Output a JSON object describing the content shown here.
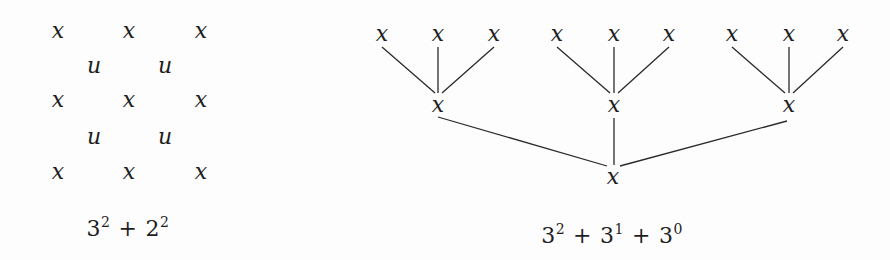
{
  "figure": {
    "background": "#fdfdfd",
    "ink": "#1e1e1e"
  },
  "left_panel": {
    "lattice": {
      "x_label": "x",
      "u_label": "u",
      "x_nodes": [
        {
          "x": 58,
          "y": 31
        },
        {
          "x": 129,
          "y": 31
        },
        {
          "x": 201,
          "y": 31
        },
        {
          "x": 58,
          "y": 100
        },
        {
          "x": 129,
          "y": 100
        },
        {
          "x": 201,
          "y": 100
        },
        {
          "x": 58,
          "y": 172
        },
        {
          "x": 129,
          "y": 172
        },
        {
          "x": 201,
          "y": 172
        }
      ],
      "u_nodes": [
        {
          "x": 94,
          "y": 66
        },
        {
          "x": 165,
          "y": 66
        },
        {
          "x": 94,
          "y": 137
        },
        {
          "x": 165,
          "y": 137
        }
      ]
    },
    "caption": {
      "terms": [
        {
          "base": "3",
          "exp": "2"
        },
        {
          "base": "2",
          "exp": "2"
        }
      ],
      "operator": "+",
      "text": "3² + 2²"
    }
  },
  "right_panel": {
    "tree": {
      "node_label": "x",
      "leaves": [
        {
          "x": 382,
          "y": 34
        },
        {
          "x": 438,
          "y": 34
        },
        {
          "x": 494,
          "y": 34
        },
        {
          "x": 557,
          "y": 34
        },
        {
          "x": 614,
          "y": 34
        },
        {
          "x": 669,
          "y": 34
        },
        {
          "x": 732,
          "y": 34
        },
        {
          "x": 789,
          "y": 34
        },
        {
          "x": 843,
          "y": 34
        }
      ],
      "middle": [
        {
          "x": 438,
          "y": 105
        },
        {
          "x": 614,
          "y": 105
        },
        {
          "x": 789,
          "y": 105
        }
      ],
      "root": {
        "x": 613,
        "y": 177
      },
      "edges": [
        [
          382,
          47,
          435,
          93
        ],
        [
          438,
          47,
          438,
          93
        ],
        [
          494,
          47,
          442,
          93
        ],
        [
          557,
          47,
          610,
          93
        ],
        [
          614,
          47,
          614,
          93
        ],
        [
          669,
          47,
          618,
          93
        ],
        [
          732,
          47,
          785,
          93
        ],
        [
          789,
          47,
          789,
          93
        ],
        [
          843,
          47,
          793,
          93
        ],
        [
          438,
          117,
          607,
          166
        ],
        [
          614,
          118,
          614,
          165
        ],
        [
          787,
          121,
          620,
          166
        ]
      ]
    },
    "caption": {
      "terms": [
        {
          "base": "3",
          "exp": "2"
        },
        {
          "base": "3",
          "exp": "1"
        },
        {
          "base": "3",
          "exp": "0"
        }
      ],
      "operator": "+",
      "text": "3² + 3¹ + 3⁰"
    }
  }
}
